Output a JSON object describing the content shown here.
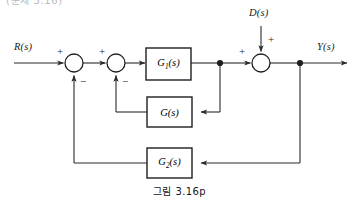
{
  "figure": {
    "caption": "그림  3.16p",
    "cropped_header_text": "(문제 3.16)",
    "type": "control-system-block-diagram",
    "line_color": "#2a2a2a",
    "block_fill": "#ffffff",
    "text_color": "#1a1a1a"
  },
  "signals": {
    "input_label": "R(s)",
    "output_label": "Y(s)",
    "disturbance_label": "D(s)"
  },
  "blocks": [
    {
      "id": "g1",
      "label_main": "G",
      "label_sub": "1",
      "label_tail": "(s)",
      "label_text": "G₁(s)",
      "x": 146,
      "y": 48,
      "w": 45,
      "h": 32
    },
    {
      "id": "g",
      "label_main": "G",
      "label_sub": "",
      "label_tail": "(s)",
      "label_text": "G(s)",
      "x": 147,
      "y": 97,
      "w": 45,
      "h": 30
    },
    {
      "id": "g2",
      "label_main": "G",
      "label_sub": "2",
      "label_tail": "(s)",
      "label_text": "G₂(s)",
      "x": 147,
      "y": 148,
      "w": 45,
      "h": 30
    }
  ],
  "summing_junctions": [
    {
      "id": "sum1",
      "cx": 74,
      "cy": 63,
      "r": 9,
      "signs": {
        "left": "+",
        "bottom": "−"
      }
    },
    {
      "id": "sum2",
      "cx": 116,
      "cy": 63,
      "r": 9,
      "signs": {
        "left": "+",
        "bottom": "−"
      }
    },
    {
      "id": "sum3",
      "cx": 261,
      "cy": 63,
      "r": 9,
      "signs": {
        "left": "+",
        "top": "+"
      }
    }
  ],
  "signs": {
    "sum1_plus": "+",
    "sum1_minus": "−",
    "sum2_plus": "+",
    "sum2_minus": "−",
    "sum3_plus": "+",
    "sum3_disturbance_plus": "+"
  },
  "nodes": [
    {
      "id": "takeoff-inner",
      "cx": 220,
      "cy": 63
    },
    {
      "id": "takeoff-outer",
      "cx": 300,
      "cy": 63
    }
  ],
  "paths": {
    "forward_main": "R(s) → sum1 → sum2 → G₁(s) → node1 → sum3 → node2 → Y(s)",
    "inner_feedback": "node1 → G(s) → sum2 (negative)",
    "outer_feedback": "node2 → G₂(s) → sum1 (negative)",
    "disturbance": "D(s) → sum3 (positive)"
  }
}
